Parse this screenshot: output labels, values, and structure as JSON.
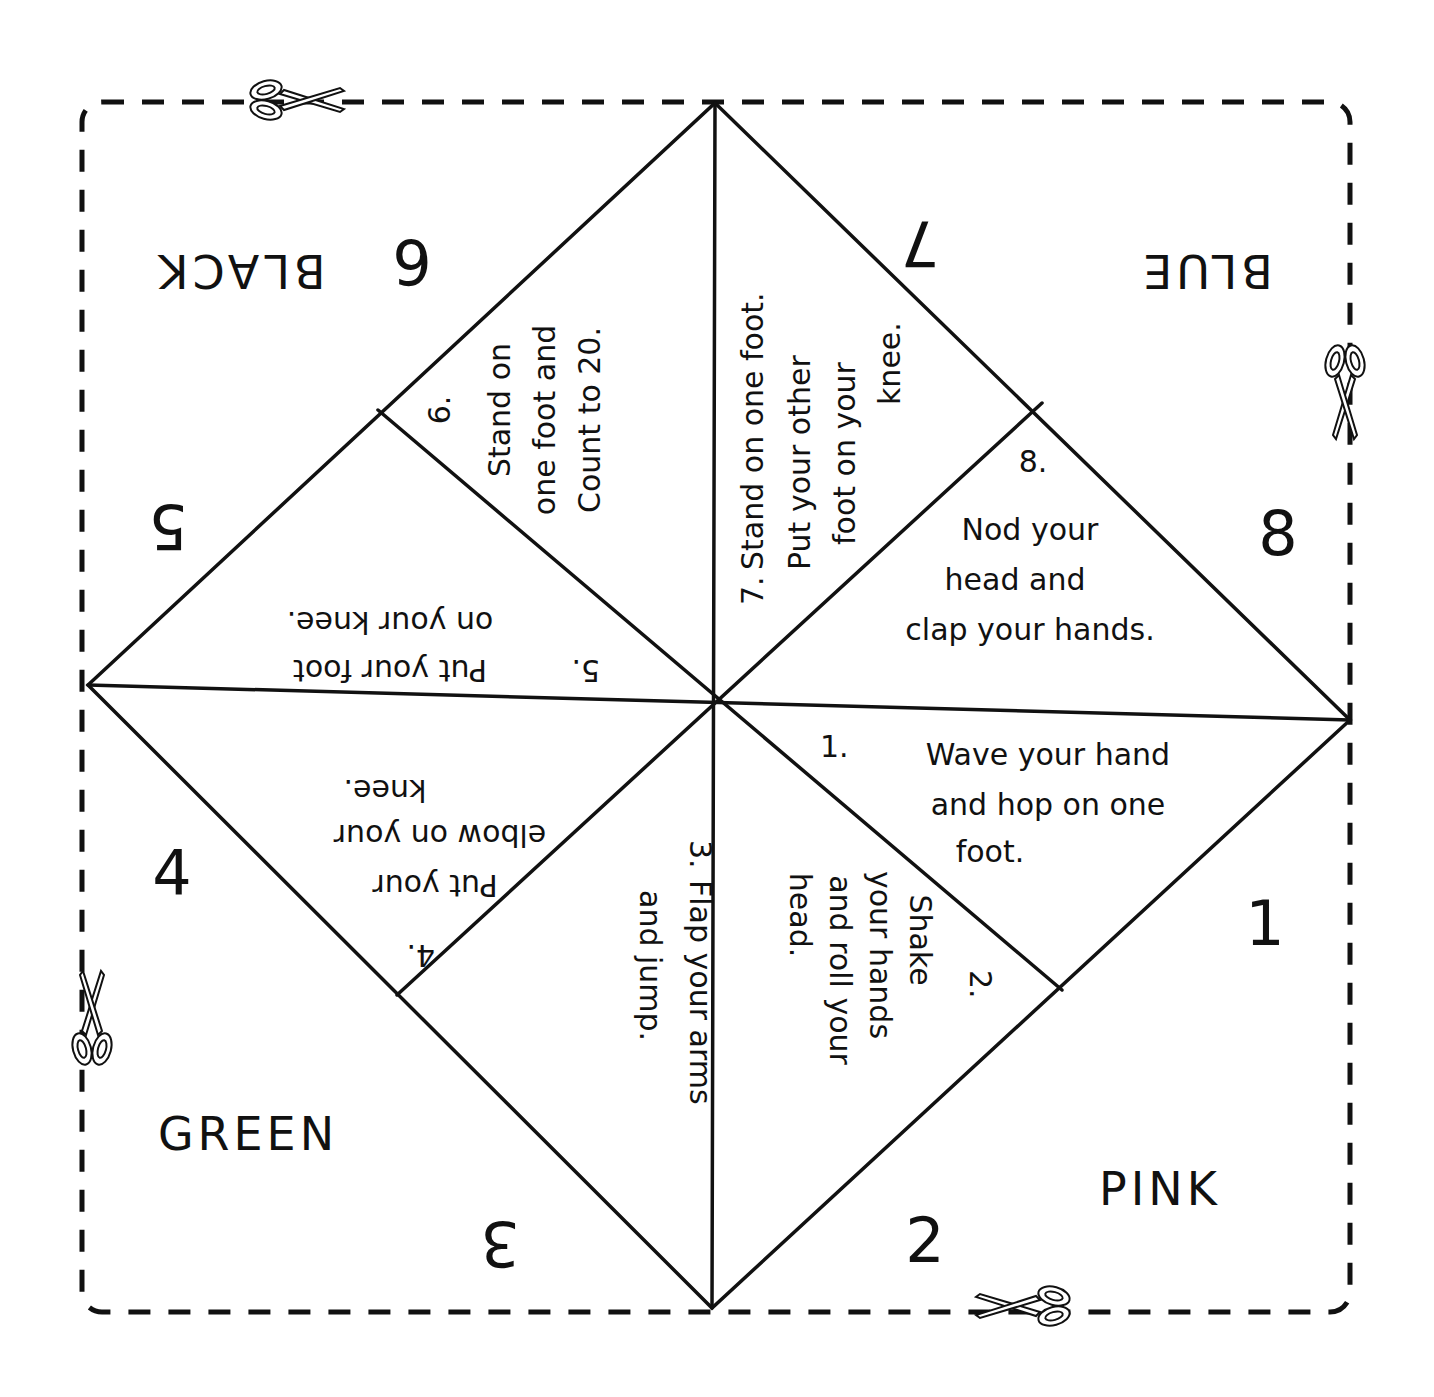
{
  "sheet": {
    "type": "fortune-teller-cootie-catcher-template",
    "colors": {
      "ink": "#111111",
      "paper": "#ffffff"
    }
  },
  "colors_outer": [
    {
      "label": "BLACK",
      "corner": "top-left",
      "orientation": "upside-down"
    },
    {
      "label": "BLUE",
      "corner": "top-right",
      "orientation": "upside-down"
    },
    {
      "label": "PINK",
      "corner": "bottom-right",
      "orientation": "upright"
    },
    {
      "label": "GREEN",
      "corner": "bottom-left",
      "orientation": "upright"
    }
  ],
  "numbers_outer": [
    {
      "label": "1",
      "position": "right-lower"
    },
    {
      "label": "2",
      "position": "bottom-right"
    },
    {
      "label": "3",
      "position": "bottom-left"
    },
    {
      "label": "4",
      "position": "left-lower"
    },
    {
      "label": "5",
      "position": "left-upper"
    },
    {
      "label": "6",
      "position": "top-left"
    },
    {
      "label": "7",
      "position": "top-right"
    },
    {
      "label": "8",
      "position": "right-upper"
    }
  ],
  "fortunes": [
    {
      "num": "1.",
      "lines": [
        "Wave your hand",
        "and hop on one",
        "foot."
      ]
    },
    {
      "num": "2.",
      "lines": [
        "Shake",
        "your hands",
        "and roll your",
        "head."
      ]
    },
    {
      "num": "3.",
      "lines": [
        "Flap your arms",
        "and jump."
      ]
    },
    {
      "num": "4.",
      "lines": [
        "Put your",
        "elbow on your",
        "knee."
      ]
    },
    {
      "num": "5.",
      "lines": [
        "Put your foot",
        "on your knee."
      ]
    },
    {
      "num": "6.",
      "lines": [
        "Stand on",
        "one foot and",
        "Count to 20."
      ]
    },
    {
      "num": "7.",
      "lines": [
        "Stand on one foot.",
        "Put your other",
        "foot on your",
        "knee."
      ]
    },
    {
      "num": "8.",
      "lines": [
        "Nod your",
        "head and",
        "clap your hands."
      ]
    }
  ],
  "cut_marks": [
    {
      "icon": "scissors-icon",
      "position": "top-edge"
    },
    {
      "icon": "scissors-icon",
      "position": "right-edge"
    },
    {
      "icon": "scissors-icon",
      "position": "left-edge"
    },
    {
      "icon": "scissors-icon",
      "position": "bottom-edge"
    }
  ]
}
